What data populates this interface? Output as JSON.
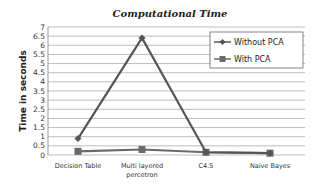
{
  "chart_data": {
    "type": "line",
    "title": "Computational Time",
    "xlabel": "",
    "ylabel": "Time in seconds",
    "categories": [
      "Decision Table",
      "Multi layered percetron",
      "C4.5",
      "Naive Bayes"
    ],
    "category_lines": [
      [
        "Decision Table"
      ],
      [
        "Multi layered",
        "percetron"
      ],
      [
        "C4.5"
      ],
      [
        "Naive Bayes"
      ]
    ],
    "series": [
      {
        "name": "Without PCA",
        "values": [
          0.9,
          6.4,
          0.15,
          0.1
        ],
        "color": "#555555",
        "marker": "diamond"
      },
      {
        "name": "With PCA",
        "values": [
          0.2,
          0.3,
          0.15,
          0.1
        ],
        "color": "#6a6a6a",
        "marker": "square"
      }
    ],
    "ylim": [
      0,
      7
    ],
    "yticks": [
      0,
      0.5,
      1,
      1.5,
      2,
      2.5,
      3,
      3.5,
      4,
      4.5,
      5,
      5.5,
      6,
      6.5,
      7
    ],
    "grid": true,
    "legend_position": "upper right"
  }
}
